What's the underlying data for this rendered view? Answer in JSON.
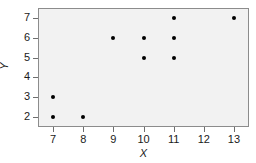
{
  "chart_data": {
    "type": "scatter",
    "title": "",
    "xlabel": "X",
    "ylabel": "Y",
    "xlim": [
      6.5,
      13.5
    ],
    "ylim": [
      1.5,
      7.5
    ],
    "xticks": [
      7,
      8,
      9,
      10,
      11,
      12,
      13
    ],
    "yticks": [
      2,
      3,
      4,
      5,
      6,
      7
    ],
    "xtick_labels": [
      "7",
      "8",
      "9",
      "10",
      "11",
      "12",
      "13"
    ],
    "ytick_labels": [
      "2",
      "3",
      "4",
      "5",
      "6",
      "7"
    ],
    "grid": false,
    "legend": null,
    "marker": "filled-circle",
    "marker_color": "#000000",
    "panel_color": "#f2f2f2",
    "frame_color": "#8c8c8c",
    "series": [
      {
        "name": "",
        "points": [
          {
            "x": 7,
            "y": 2
          },
          {
            "x": 7,
            "y": 3
          },
          {
            "x": 8,
            "y": 2
          },
          {
            "x": 9,
            "y": 6
          },
          {
            "x": 10,
            "y": 5
          },
          {
            "x": 10,
            "y": 6
          },
          {
            "x": 11,
            "y": 5
          },
          {
            "x": 11,
            "y": 6
          },
          {
            "x": 11,
            "y": 7
          },
          {
            "x": 13,
            "y": 7
          }
        ]
      }
    ]
  }
}
